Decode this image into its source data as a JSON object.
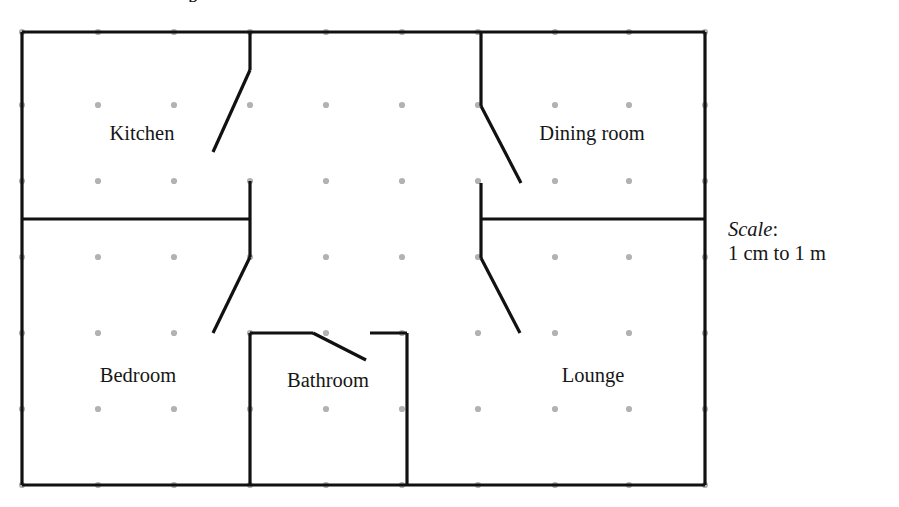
{
  "diagram": {
    "type": "floor-plan",
    "title_fragment": "p",
    "units": "pixels",
    "canvas": {
      "width": 899,
      "height": 507
    },
    "colors": {
      "wall": "#111111",
      "grid_dot": "#b2b2b2",
      "text": "#161616",
      "background": "#ffffff"
    },
    "grid": {
      "spacing": 76,
      "x_values": [
        22,
        98,
        174,
        250,
        326,
        402,
        478,
        555,
        629,
        705
      ],
      "y_values": [
        32,
        105,
        181,
        257,
        333,
        409,
        485
      ],
      "dot_radius": 3.1
    },
    "outline": {
      "left": 22,
      "top": 32,
      "right": 705,
      "bottom": 485
    },
    "walls": [
      {
        "name": "outer-wall-top",
        "x1": 22,
        "y1": 32,
        "x2": 705,
        "y2": 32
      },
      {
        "name": "outer-wall-right",
        "x1": 705,
        "y1": 32,
        "x2": 705,
        "y2": 485
      },
      {
        "name": "outer-wall-bottom",
        "x1": 22,
        "y1": 485,
        "x2": 705,
        "y2": 485
      },
      {
        "name": "outer-wall-left",
        "x1": 22,
        "y1": 32,
        "x2": 22,
        "y2": 485
      },
      {
        "name": "kitchen-right-wall",
        "x1": 250,
        "y1": 32,
        "x2": 250,
        "y2": 70
      },
      {
        "name": "hall-left-wall-upper",
        "x1": 250,
        "y1": 181,
        "x2": 250,
        "y2": 257
      },
      {
        "name": "bedroom-top-wall",
        "x1": 22,
        "y1": 219,
        "x2": 250,
        "y2": 219
      },
      {
        "name": "dining-left-wall",
        "x1": 481,
        "y1": 32,
        "x2": 481,
        "y2": 106
      },
      {
        "name": "hall-right-wall-upper",
        "x1": 481,
        "y1": 183,
        "x2": 481,
        "y2": 258
      },
      {
        "name": "lounge-top-wall",
        "x1": 481,
        "y1": 219,
        "x2": 705,
        "y2": 219
      },
      {
        "name": "bathroom-left-wall",
        "x1": 250,
        "y1": 333,
        "x2": 250,
        "y2": 485
      },
      {
        "name": "bathroom-right-wall",
        "x1": 407,
        "y1": 333,
        "x2": 407,
        "y2": 485
      },
      {
        "name": "bathroom-top-wall-left",
        "x1": 250,
        "y1": 333,
        "x2": 313,
        "y2": 333
      },
      {
        "name": "bathroom-top-wall-right",
        "x1": 370,
        "y1": 333,
        "x2": 407,
        "y2": 333
      }
    ],
    "door_swings": [
      {
        "name": "kitchen-door-swing",
        "x1": 250,
        "y1": 70,
        "x2": 213,
        "y2": 152
      },
      {
        "name": "bedroom-door-swing",
        "x1": 250,
        "y1": 257,
        "x2": 213,
        "y2": 333
      },
      {
        "name": "dining-door-swing",
        "x1": 481,
        "y1": 106,
        "x2": 521,
        "y2": 183
      },
      {
        "name": "lounge-door-swing",
        "x1": 481,
        "y1": 258,
        "x2": 520,
        "y2": 333
      },
      {
        "name": "bathroom-door-swing",
        "x1": 313,
        "y1": 333,
        "x2": 366,
        "y2": 360
      }
    ],
    "rooms": [
      {
        "name": "kitchen",
        "label": "Kitchen",
        "label_x": 142,
        "label_y": 140
      },
      {
        "name": "dining-room",
        "label": "Dining room",
        "label_x": 592,
        "label_y": 140
      },
      {
        "name": "bedroom",
        "label": "Bedroom",
        "label_x": 138,
        "label_y": 382
      },
      {
        "name": "bathroom",
        "label": "Bathroom",
        "label_x": 328,
        "label_y": 387
      },
      {
        "name": "lounge",
        "label": "Lounge",
        "label_x": 593,
        "label_y": 382
      }
    ],
    "scale": {
      "word": "Scale",
      "colon": ":",
      "value": "1 cm to 1 m"
    }
  }
}
